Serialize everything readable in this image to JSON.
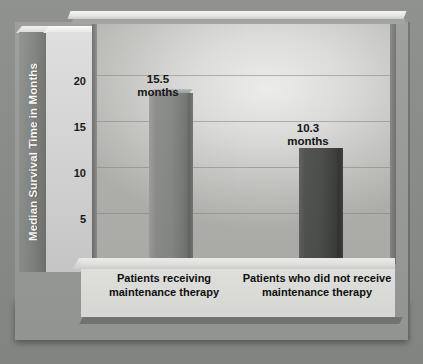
{
  "chart_data": {
    "type": "bar",
    "title": "",
    "xlabel": "",
    "ylabel": "Median Survival Time in Months",
    "ylim": [
      0,
      22
    ],
    "yticks": [
      0,
      5,
      10,
      15,
      20
    ],
    "ytick_labels": [
      "0",
      "5",
      "10",
      "15",
      "20"
    ],
    "grid": true,
    "legend": "none",
    "categories": [
      "Patients receiving\nmaintenance therapy",
      "Patients who did\nnot receive\nmaintenance therapy"
    ],
    "values": [
      15.5,
      10.3
    ],
    "unit": "months",
    "data_labels": [
      "15.5\nmonths",
      "10.3\nmonths"
    ],
    "bar_colors": [
      "#8a8c8a",
      "#4d4f4d"
    ]
  },
  "axis": {
    "y_title": "Median Survival Time in Months",
    "ticks": [
      {
        "label": "20",
        "value": 20
      },
      {
        "label": "15",
        "value": 15
      },
      {
        "label": "10",
        "value": 10
      },
      {
        "label": "5",
        "value": 5
      },
      {
        "label": "0",
        "value": 0
      }
    ]
  },
  "bars": [
    {
      "value_label": "15.5\nmonths",
      "category_label": "Patients receiving\nmaintenance therapy",
      "value": 15.5,
      "color": "#8a8c8a"
    },
    {
      "value_label": "10.3\nmonths",
      "category_label": "Patients who did\nnot receive\nmaintenance therapy",
      "value": 10.3,
      "color": "#4d4f4d"
    }
  ],
  "colors": {
    "background": "#8a8c8a",
    "frame": "#9a9c9a",
    "plot_light": "#efefee",
    "plot_dark": "#b0b0ad",
    "bar_light": "#8a8c8a",
    "bar_dark": "#4d4f4d",
    "text": "#0d0d0d",
    "axis_title_text": "#ffffff"
  }
}
